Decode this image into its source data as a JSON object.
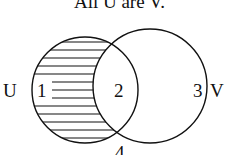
{
  "title": "All U are V.",
  "diagram": {
    "type": "venn",
    "sets": [
      {
        "name": "U",
        "label": "U",
        "shaded_region": "1"
      },
      {
        "name": "V",
        "label": "V"
      }
    ],
    "regions": [
      {
        "id": "1",
        "label": "1",
        "description": "U only",
        "shaded": true
      },
      {
        "id": "2",
        "label": "2",
        "description": "U and V",
        "shaded": false
      },
      {
        "id": "3",
        "label": "3",
        "description": "V only",
        "shaded": false
      },
      {
        "id": "4",
        "label": "4",
        "description": "outside both",
        "shaded": false
      }
    ],
    "colors": {
      "stroke": "#111111",
      "background": "#ffffff"
    }
  }
}
